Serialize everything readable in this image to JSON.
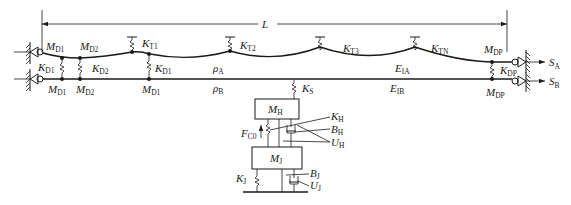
{
  "diagram": {
    "length_label": "L",
    "outputs": {
      "S_A": {
        "main": "S",
        "sub": "A"
      },
      "S_B": {
        "main": "S",
        "sub": "B"
      }
    },
    "upper_cable": {
      "labels": {
        "M_D1_left": {
          "main": "M",
          "sub": "D1"
        },
        "M_D2_top": {
          "main": "M",
          "sub": "D2"
        },
        "K_T1": {
          "main": "K",
          "sub": "T1"
        },
        "K_T2": {
          "main": "K",
          "sub": "T2"
        },
        "K_T3": {
          "main": "K",
          "sub": "T3"
        },
        "K_TN": {
          "main": "K",
          "sub": "TN"
        },
        "M_DP_top": {
          "main": "M",
          "sub": "DP"
        },
        "rho_A": {
          "main": "ρ",
          "sub": "A"
        },
        "E_IA": {
          "main": "E",
          "sub": "IA"
        }
      }
    },
    "connectors": {
      "K_D1_left": {
        "main": "K",
        "sub": "D1"
      },
      "K_D2": {
        "main": "K",
        "sub": "D2"
      },
      "K_D1_mid": {
        "main": "K",
        "sub": "D1"
      },
      "K_DP": {
        "main": "K",
        "sub": "DP"
      }
    },
    "lower_cable": {
      "labels": {
        "M_D1_left": {
          "main": "M",
          "sub": "D1"
        },
        "M_D2": {
          "main": "M",
          "sub": "D2"
        },
        "M_D1_mid": {
          "main": "M",
          "sub": "D1"
        },
        "rho_B": {
          "main": "ρ",
          "sub": "B"
        },
        "E_IB": {
          "main": "E",
          "sub": "IB"
        },
        "M_DP": {
          "main": "M",
          "sub": "DP"
        }
      }
    },
    "suspension": {
      "K_S": {
        "main": "K",
        "sub": "S"
      },
      "M_H": {
        "main": "M",
        "sub": "H"
      },
      "K_H": {
        "main": "K",
        "sub": "H"
      },
      "B_H": {
        "main": "B",
        "sub": "H"
      },
      "U_H": {
        "main": "U",
        "sub": "H"
      },
      "F_C0": {
        "main": "F",
        "sub": "C0"
      },
      "M_J": {
        "main": "M",
        "sub": "J"
      },
      "K_J": {
        "main": "K",
        "sub": "J"
      },
      "B_J": {
        "main": "B",
        "sub": "J"
      },
      "U_J": {
        "main": "U",
        "sub": "J"
      }
    }
  }
}
